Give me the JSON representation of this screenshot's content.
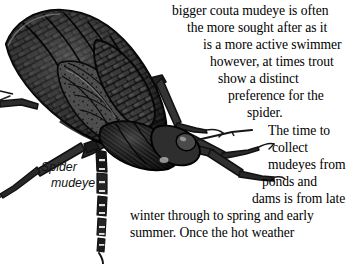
{
  "page": {
    "background_color": "#ffffff",
    "text_color": "#000000",
    "width": 361,
    "height": 264
  },
  "illustration": {
    "name": "spider-mudeye-illustration",
    "subject": "Spider mudeye (dragonfly nymph) halftone engraving",
    "ink_color": "#1a1a1a",
    "mid_tone_color": "#4a4a4a",
    "light_tone_color": "#8c8c8c"
  },
  "caption": {
    "line1": "Spider",
    "line2": "mudeye"
  },
  "body_text": {
    "partial_top_line": "prey, particularly, the",
    "lines": [
      {
        "text": "bigger couta mudeye is often",
        "x": 172,
        "y": 4
      },
      {
        "text": "the more sought after as it",
        "x": 187,
        "y": 21
      },
      {
        "text": "is a more active swimmer",
        "x": 203,
        "y": 38
      },
      {
        "text": "however, at times trout",
        "x": 210,
        "y": 55
      },
      {
        "text": "show a distinct",
        "x": 218,
        "y": 72
      },
      {
        "text": "preference for the",
        "x": 228,
        "y": 89
      },
      {
        "text": "spider.",
        "x": 247,
        "y": 106
      },
      {
        "text": "The time to",
        "x": 268,
        "y": 124
      },
      {
        "text": "collect",
        "x": 272,
        "y": 141
      },
      {
        "text": "mudeyes from",
        "x": 268,
        "y": 158
      },
      {
        "text": "ponds and",
        "x": 262,
        "y": 175
      },
      {
        "text": "dams is from late",
        "x": 252,
        "y": 192
      },
      {
        "text": "winter through to spring and early",
        "x": 130,
        "y": 209
      },
      {
        "text": "summer. Once the hot weather",
        "x": 130,
        "y": 226
      }
    ],
    "full_paragraph": "bigger couta mudeye is often the more sought after as it is a more active swimmer however, at times trout show a distinct preference for the spider. The time to collect mudeyes from ponds and dams is from late winter through to spring and early summer. Once the hot weather"
  }
}
